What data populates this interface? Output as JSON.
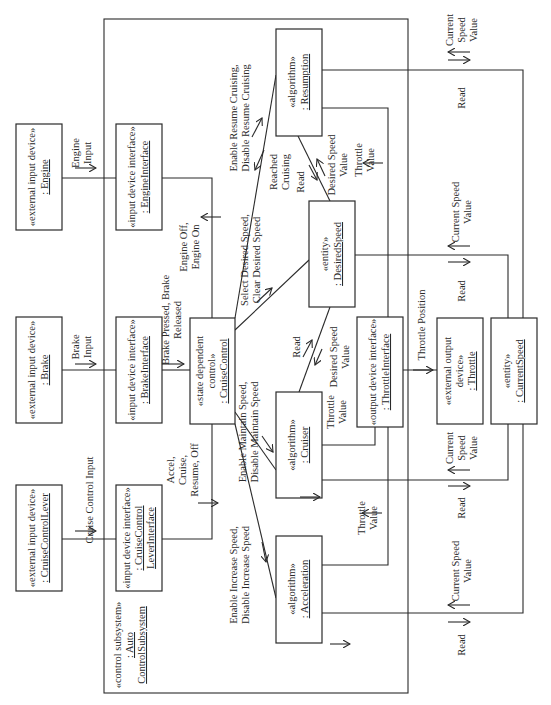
{
  "diagram": {
    "type": "UML communication diagram",
    "orientation": "rotated 90° counter-clockwise",
    "subsystem": {
      "stereotype": "«control subsystem»",
      "name_line1": ": Auto",
      "name_line2": "ControlSubsystem"
    },
    "objects": {
      "engine": {
        "stereotype": "«external input device»",
        "name": ": Engine"
      },
      "brake": {
        "stereotype": "«external input device»",
        "name": ": Brake"
      },
      "lever": {
        "stereotype": "«external input device»",
        "name": ": CruiseControlLever"
      },
      "engine_if": {
        "stereotype": "«input device interface»",
        "name": ": EngineInterface"
      },
      "brake_if": {
        "stereotype": "«input device interface»",
        "name": ": BrakeInterface"
      },
      "lever_if": {
        "stereotype": "«input device interface»",
        "name_line1": ": CruiseControl",
        "name_line2": "LeverInterface"
      },
      "cruise_control": {
        "stereotype_line1": "«state dependent",
        "stereotype_line2": "control»",
        "name": ": CruiseControl"
      },
      "resumption": {
        "stereotype": "«algorithm»",
        "name": ": Resumption"
      },
      "desired_speed": {
        "stereotype": "«entity»",
        "name": ": DesiredSpeed"
      },
      "cruiser": {
        "stereotype": "«algorithm»",
        "name": ": Cruiser"
      },
      "acceleration": {
        "stereotype": "«algorithm»",
        "name": ": Acceleration"
      },
      "throttle_if": {
        "stereotype": "«output device interface»",
        "name": ": ThrottleInterface"
      },
      "throttle": {
        "stereotype_line1": "«external output",
        "stereotype_line2": "device»",
        "name": ": Throttle"
      },
      "current_speed": {
        "stereotype": "«entity»",
        "name": ": CurrentSpeed"
      }
    },
    "messages": {
      "engine_input": [
        "Engine",
        "Input"
      ],
      "brake_input": [
        "Brake",
        "Input"
      ],
      "lever_input": [
        "Cruise Control Input"
      ],
      "engine_onoff": [
        "Engine Off,",
        "Engine On"
      ],
      "brake_pr": [
        "Brake Pressed, Brake",
        "Released"
      ],
      "lever_cmds": [
        "Accel,",
        "Cruise,",
        "Resume, Off"
      ],
      "resume_cruise": [
        "Enable Resume Cruising,",
        "Disable Resume Cruising"
      ],
      "reached_cruising": [
        "Reached",
        "Cruising"
      ],
      "select_desired": [
        "Select Desired Speed,",
        "Clear Desired Speed"
      ],
      "maintain_speed": [
        "Enable Maintain Speed,",
        "Disable Maintain Speed"
      ],
      "increase_speed": [
        "Enable Increase Speed,",
        "Disable Increase Speed"
      ],
      "res_read": [
        "Read"
      ],
      "res_desired_val": [
        "Desired Speed",
        "Value"
      ],
      "res_throttle_val": [
        "Throttle",
        "Value"
      ],
      "cru_read": [
        "Read"
      ],
      "cru_desired_val": [
        "Desired Speed",
        "Value"
      ],
      "cru_throttle_val": [
        "Throttle",
        "Value"
      ],
      "acc_throttle_val": [
        "Throttle",
        "Value"
      ],
      "throttle_pos": [
        "Throttle Position"
      ],
      "res_cs_val": [
        "Current",
        "Speed",
        "Value"
      ],
      "res_cs_read": [
        "Read"
      ],
      "ds_cs_val": [
        "Current Speed",
        "Value"
      ],
      "ds_cs_read": [
        "Read"
      ],
      "cru_cs_val": [
        "Current",
        "Speed",
        "Value"
      ],
      "cru_cs_read": [
        "Read"
      ],
      "acc_cs_val": [
        "Current Speed",
        "Value"
      ],
      "acc_cs_read": [
        "Read"
      ]
    }
  }
}
